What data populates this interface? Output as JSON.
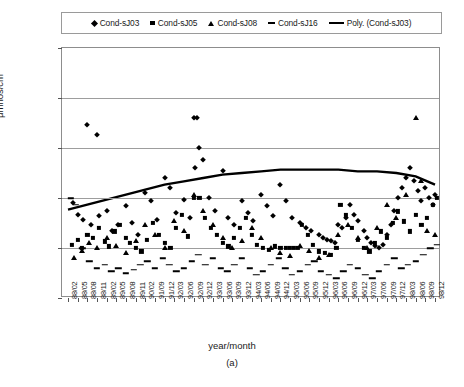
{
  "chart_data": {
    "type": "scatter",
    "title": "",
    "xlabel": "year/month",
    "ylabel": "μmhos/cm",
    "caption": "(a)",
    "ylim": [
      0,
      150
    ],
    "yticks": [
      0,
      30,
      60,
      90,
      120,
      150
    ],
    "grid": true,
    "legend_position": "top",
    "categories": [
      "88/02",
      "88/05",
      "88/08",
      "88/11",
      "89/02",
      "89/05",
      "89/08",
      "89/11",
      "90/02",
      "91/09",
      "91/12",
      "92/03",
      "92/06",
      "92/09",
      "92/12",
      "93/03",
      "93/06",
      "93/09",
      "93/12",
      "94/03",
      "94/06",
      "94/09",
      "94/12",
      "95/03",
      "95/06",
      "95/09",
      "95/12",
      "96/03",
      "96/06",
      "96/09",
      "96/12",
      "97/03",
      "97/06",
      "97/09",
      "97/12",
      "98/03",
      "98/06",
      "98/09",
      "98/12"
    ],
    "series": [
      {
        "name": "Cond-sJ03",
        "marker": "diamond",
        "points": [
          [
            2.0,
            104
          ],
          [
            3.0,
            98
          ],
          [
            13.0,
            108
          ],
          [
            13.4,
            108
          ],
          [
            13.6,
            90
          ],
          [
            16.0,
            76
          ],
          [
            0.5,
            57
          ],
          [
            1.0,
            50
          ],
          [
            1.6,
            47
          ],
          [
            2.4,
            44
          ],
          [
            3.2,
            49
          ],
          [
            4.0,
            52
          ],
          [
            4.6,
            40
          ],
          [
            5.2,
            44
          ],
          [
            6.0,
            55
          ],
          [
            6.6,
            45
          ],
          [
            7.2,
            38
          ],
          [
            8.0,
            63
          ],
          [
            8.6,
            58
          ],
          [
            9.2,
            47
          ],
          [
            10.0,
            72
          ],
          [
            10.6,
            66
          ],
          [
            11.2,
            51
          ],
          [
            12.0,
            59
          ],
          [
            12.6,
            48
          ],
          [
            13.2,
            78
          ],
          [
            14.0,
            83
          ],
          [
            14.6,
            60
          ],
          [
            15.2,
            52
          ],
          [
            16.6,
            48
          ],
          [
            17.2,
            44
          ],
          [
            18.0,
            58
          ],
          [
            18.6,
            51
          ],
          [
            19.2,
            46
          ],
          [
            20.0,
            62
          ],
          [
            20.6,
            55
          ],
          [
            21.2,
            49
          ],
          [
            22.0,
            68
          ],
          [
            22.6,
            58
          ],
          [
            23.2,
            48
          ],
          [
            24.0,
            45
          ],
          [
            24.6,
            42
          ],
          [
            25.2,
            40
          ],
          [
            26.0,
            38
          ],
          [
            26.4,
            36
          ],
          [
            26.8,
            35
          ],
          [
            27.2,
            34
          ],
          [
            27.6,
            33
          ],
          [
            28.0,
            44
          ],
          [
            28.4,
            42
          ],
          [
            28.8,
            48
          ],
          [
            29.2,
            56
          ],
          [
            29.6,
            50
          ],
          [
            30.0,
            46
          ],
          [
            30.6,
            40
          ],
          [
            31.0,
            36
          ],
          [
            31.4,
            33
          ],
          [
            31.8,
            31
          ],
          [
            32.2,
            30
          ],
          [
            32.6,
            32
          ],
          [
            33.0,
            38
          ],
          [
            33.4,
            44
          ],
          [
            33.8,
            52
          ],
          [
            34.2,
            60
          ],
          [
            34.6,
            66
          ],
          [
            35.0,
            72
          ],
          [
            35.4,
            78
          ],
          [
            35.8,
            70
          ],
          [
            36.2,
            64
          ],
          [
            36.6,
            58
          ],
          [
            37.0,
            66
          ],
          [
            37.4,
            60
          ],
          [
            37.8,
            56
          ],
          [
            38.0,
            62
          ]
        ]
      },
      {
        "name": "Cond-sJ05",
        "marker": "square",
        "points": [
          [
            0.4,
            32
          ],
          [
            1.0,
            35
          ],
          [
            1.4,
            30
          ],
          [
            2.0,
            38
          ],
          [
            2.6,
            36
          ],
          [
            3.2,
            42
          ],
          [
            3.8,
            34
          ],
          [
            4.2,
            31
          ],
          [
            4.8,
            40
          ],
          [
            5.4,
            44
          ],
          [
            6.0,
            36
          ],
          [
            6.4,
            33
          ],
          [
            7.0,
            30
          ],
          [
            7.6,
            28
          ],
          [
            8.2,
            35
          ],
          [
            8.8,
            45
          ],
          [
            9.4,
            38
          ],
          [
            10.0,
            33
          ],
          [
            10.6,
            30
          ],
          [
            11.2,
            42
          ],
          [
            11.8,
            50
          ],
          [
            12.4,
            37
          ],
          [
            13.0,
            60
          ],
          [
            13.6,
            60
          ],
          [
            14.2,
            48
          ],
          [
            14.8,
            42
          ],
          [
            15.4,
            38
          ],
          [
            16.0,
            33
          ],
          [
            16.6,
            31
          ],
          [
            17.2,
            36
          ],
          [
            17.8,
            42
          ],
          [
            18.4,
            48
          ],
          [
            19.0,
            38
          ],
          [
            19.6,
            32
          ],
          [
            20.2,
            30
          ],
          [
            20.8,
            29
          ],
          [
            21.4,
            31
          ],
          [
            22.0,
            30
          ],
          [
            22.6,
            30
          ],
          [
            23.0,
            30
          ],
          [
            23.4,
            30
          ],
          [
            23.8,
            30
          ],
          [
            24.2,
            44
          ],
          [
            24.8,
            38
          ],
          [
            25.4,
            32
          ],
          [
            26.0,
            28
          ],
          [
            26.6,
            27
          ],
          [
            27.2,
            26
          ],
          [
            27.8,
            30
          ],
          [
            28.2,
            56
          ],
          [
            28.8,
            50
          ],
          [
            29.4,
            42
          ],
          [
            30.0,
            35
          ],
          [
            30.6,
            30
          ],
          [
            31.2,
            28
          ],
          [
            31.8,
            33
          ],
          [
            32.4,
            40
          ],
          [
            33.0,
            36
          ],
          [
            33.6,
            45
          ],
          [
            34.2,
            52
          ],
          [
            34.8,
            46
          ],
          [
            35.4,
            40
          ],
          [
            36.0,
            50
          ],
          [
            36.6,
            44
          ],
          [
            37.2,
            48
          ],
          [
            37.8,
            56
          ],
          [
            38.2,
            60
          ]
        ]
      },
      {
        "name": "Cond-sJ08",
        "marker": "triangle",
        "points": [
          [
            0.6,
            24
          ],
          [
            1.4,
            28
          ],
          [
            2.2,
            33
          ],
          [
            3.0,
            30
          ],
          [
            4.0,
            36
          ],
          [
            5.0,
            31
          ],
          [
            6.0,
            27
          ],
          [
            7.0,
            34
          ],
          [
            8.0,
            44
          ],
          [
            9.0,
            38
          ],
          [
            10.0,
            30
          ],
          [
            11.0,
            46
          ],
          [
            12.0,
            40
          ],
          [
            13.0,
            62
          ],
          [
            14.0,
            52
          ],
          [
            15.0,
            44
          ],
          [
            16.0,
            36
          ],
          [
            17.0,
            30
          ],
          [
            18.0,
            34
          ],
          [
            19.0,
            42
          ],
          [
            20.0,
            36
          ],
          [
            21.0,
            30
          ],
          [
            22.0,
            27
          ],
          [
            23.0,
            25
          ],
          [
            24.0,
            31
          ],
          [
            25.0,
            28
          ],
          [
            26.0,
            24
          ],
          [
            27.0,
            26
          ],
          [
            28.0,
            38
          ],
          [
            29.0,
            44
          ],
          [
            30.0,
            36
          ],
          [
            31.0,
            30
          ],
          [
            32.0,
            42
          ],
          [
            33.0,
            56
          ],
          [
            34.0,
            48
          ],
          [
            35.0,
            62
          ],
          [
            36.0,
            108
          ],
          [
            36.6,
            70
          ],
          [
            37.2,
            40
          ],
          [
            38.0,
            38
          ]
        ]
      },
      {
        "name": "Cond-sJ16",
        "marker": "dash",
        "points": [
          [
            0.3,
            60
          ],
          [
            0.8,
            56
          ],
          [
            1.5,
            30
          ],
          [
            2.2,
            22
          ],
          [
            3.0,
            18
          ],
          [
            3.8,
            20
          ],
          [
            4.5,
            16
          ],
          [
            5.2,
            18
          ],
          [
            6.0,
            15
          ],
          [
            6.8,
            17
          ],
          [
            7.5,
            20
          ],
          [
            8.2,
            22
          ],
          [
            9.0,
            18
          ],
          [
            9.8,
            24
          ],
          [
            10.5,
            20
          ],
          [
            11.2,
            16
          ],
          [
            12.0,
            18
          ],
          [
            12.8,
            22
          ],
          [
            13.5,
            26
          ],
          [
            14.2,
            20
          ],
          [
            15.0,
            24
          ],
          [
            15.8,
            18
          ],
          [
            16.5,
            16
          ],
          [
            17.2,
            20
          ],
          [
            18.0,
            24
          ],
          [
            18.8,
            18
          ],
          [
            19.5,
            14
          ],
          [
            20.2,
            16
          ],
          [
            21.0,
            20
          ],
          [
            21.8,
            24
          ],
          [
            22.5,
            18
          ],
          [
            23.2,
            14
          ],
          [
            24.0,
            16
          ],
          [
            24.8,
            20
          ],
          [
            25.5,
            22
          ],
          [
            26.2,
            16
          ],
          [
            27.0,
            14
          ],
          [
            27.8,
            12
          ],
          [
            28.5,
            16
          ],
          [
            29.2,
            20
          ],
          [
            30.0,
            18
          ],
          [
            30.8,
            14
          ],
          [
            31.5,
            12
          ],
          [
            32.2,
            16
          ],
          [
            33.0,
            20
          ],
          [
            33.8,
            24
          ],
          [
            34.5,
            18
          ],
          [
            35.2,
            20
          ],
          [
            36.0,
            22
          ],
          [
            36.8,
            26
          ],
          [
            37.5,
            30
          ],
          [
            38.2,
            32
          ]
        ]
      }
    ],
    "trend": {
      "name": "Poly. (Cond-sJ03)",
      "points": [
        [
          0,
          53
        ],
        [
          2,
          56
        ],
        [
          4,
          59
        ],
        [
          6,
          62
        ],
        [
          8,
          65
        ],
        [
          10,
          68
        ],
        [
          12,
          70
        ],
        [
          14,
          72
        ],
        [
          16,
          74
        ],
        [
          18,
          75
        ],
        [
          20,
          76
        ],
        [
          22,
          77
        ],
        [
          24,
          77
        ],
        [
          26,
          77
        ],
        [
          28,
          77
        ],
        [
          30,
          76
        ],
        [
          32,
          76
        ],
        [
          34,
          75
        ],
        [
          36,
          73
        ],
        [
          38,
          68
        ]
      ]
    }
  },
  "legend": {
    "items": [
      {
        "label": "Cond-sJ03",
        "marker": "diamond"
      },
      {
        "label": "Cond-sJ05",
        "marker": "square"
      },
      {
        "label": "Cond-sJ08",
        "marker": "triangle"
      },
      {
        "label": "Cond-sJ16",
        "marker": "dash"
      },
      {
        "label": "Poly. (Cond-sJ03)",
        "marker": "line"
      }
    ]
  }
}
